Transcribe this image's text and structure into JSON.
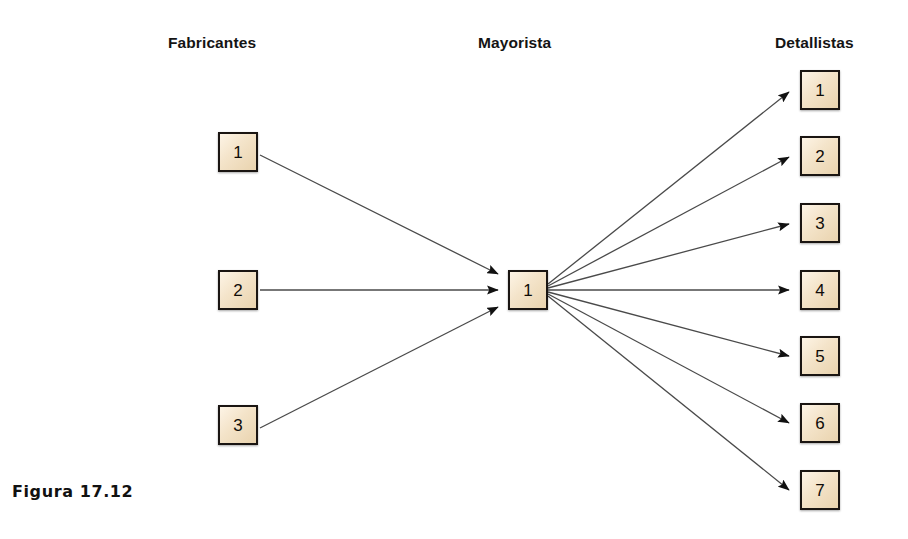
{
  "figure": {
    "caption": "Figura 17.12",
    "background_color": "#ffffff",
    "line_color": "#4a4a4a",
    "box_border_color": "#1a1512",
    "box_fill_color": "#f2e3cb",
    "text_color": "#111111"
  },
  "columns": [
    {
      "id": "fabricantes",
      "heading": "Fabricantes",
      "x": 168,
      "y": 34
    },
    {
      "id": "mayorista",
      "heading": "Mayorista",
      "x": 478,
      "y": 34
    },
    {
      "id": "detallistas",
      "heading": "Detallistas",
      "x": 775,
      "y": 34
    }
  ],
  "nodes": {
    "fabricantes": [
      {
        "label": "1",
        "x": 218,
        "y": 132
      },
      {
        "label": "2",
        "x": 218,
        "y": 270
      },
      {
        "label": "3",
        "x": 218,
        "y": 405
      }
    ],
    "mayorista": [
      {
        "label": "1",
        "x": 508,
        "y": 270
      }
    ],
    "detallistas": [
      {
        "label": "1",
        "x": 800,
        "y": 70
      },
      {
        "label": "2",
        "x": 800,
        "y": 136
      },
      {
        "label": "3",
        "x": 800,
        "y": 203
      },
      {
        "label": "4",
        "x": 800,
        "y": 270
      },
      {
        "label": "5",
        "x": 800,
        "y": 336
      },
      {
        "label": "6",
        "x": 800,
        "y": 403
      },
      {
        "label": "7",
        "x": 800,
        "y": 470
      }
    ]
  },
  "links": {
    "inbound": [
      {
        "from": "fabricantes.1",
        "to": "mayorista.1",
        "x1": 260,
        "y1": 155,
        "x2": 498,
        "y2": 274
      },
      {
        "from": "fabricantes.2",
        "to": "mayorista.1",
        "x1": 260,
        "y1": 290,
        "x2": 498,
        "y2": 290
      },
      {
        "from": "fabricantes.3",
        "to": "mayorista.1",
        "x1": 260,
        "y1": 428,
        "x2": 498,
        "y2": 307
      }
    ],
    "outbound": [
      {
        "from": "mayorista.1",
        "to": "detallistas.1",
        "x1": 548,
        "y1": 284,
        "x2": 789,
        "y2": 92
      },
      {
        "from": "mayorista.1",
        "to": "detallistas.2",
        "x1": 548,
        "y1": 286,
        "x2": 789,
        "y2": 157
      },
      {
        "from": "mayorista.1",
        "to": "detallistas.3",
        "x1": 548,
        "y1": 288,
        "x2": 789,
        "y2": 224
      },
      {
        "from": "mayorista.1",
        "to": "detallistas.4",
        "x1": 548,
        "y1": 290,
        "x2": 789,
        "y2": 290
      },
      {
        "from": "mayorista.1",
        "to": "detallistas.5",
        "x1": 548,
        "y1": 292,
        "x2": 789,
        "y2": 356
      },
      {
        "from": "mayorista.1",
        "to": "detallistas.6",
        "x1": 548,
        "y1": 294,
        "x2": 789,
        "y2": 423
      },
      {
        "from": "mayorista.1",
        "to": "detallistas.7",
        "x1": 548,
        "y1": 296,
        "x2": 789,
        "y2": 490
      }
    ]
  }
}
